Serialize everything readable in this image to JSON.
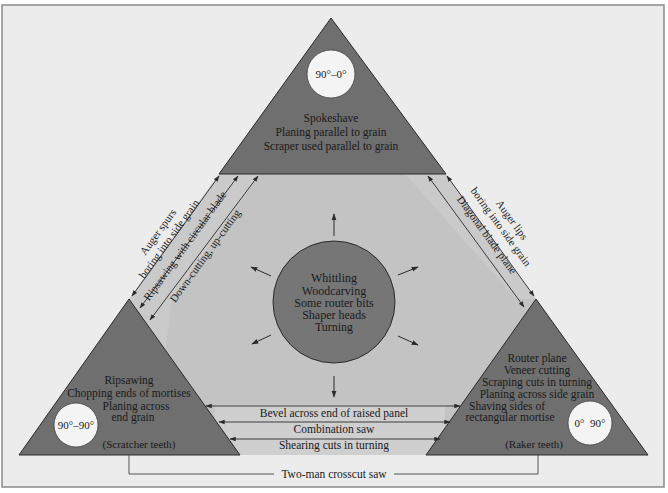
{
  "colors": {
    "background": "#ececec",
    "frame": "#8a8a8a",
    "hexagon": "#c3c3c3",
    "band": "#cfcfcf",
    "triangle": "#6f6f6f",
    "circle_center": "#767676",
    "angle_circle": "#f4f4f4",
    "line": "#2a2a2a"
  },
  "top_triangle": {
    "angle": "90°–0°",
    "lines": [
      "Spokeshave",
      "Planing parallel to grain",
      "Scraper used parallel to grain"
    ]
  },
  "left_triangle": {
    "angle": "90°–90°",
    "lines": [
      "Ripsawing",
      "Chopping ends of mortises",
      "Planing across",
      "end grain"
    ],
    "teeth": "(Scratcher teeth)"
  },
  "right_triangle": {
    "angle": "0°  90°",
    "lines": [
      "Router plane",
      "Veneer cutting",
      "Scraping cuts in turning",
      "Planing across side grain",
      "Shaving sides of",
      "rectangular mortise"
    ],
    "teeth": "(Raker teeth)"
  },
  "center": {
    "lines": [
      "Whittling",
      "Woodcarving",
      "Some router bits",
      "Shaper heads",
      "Turning"
    ]
  },
  "left_band": {
    "labels": [
      "Auger spurs",
      "boring into side grain",
      "Ripsawing with circular blade",
      "Down-cutting, up-cutting"
    ]
  },
  "right_band": {
    "labels": [
      "Auger lips",
      "boring into side grain",
      "Diagonal blade plane"
    ]
  },
  "bottom_band": {
    "labels": [
      "Bevel across end of raised panel",
      "Combination saw",
      "Shearing cuts in turning"
    ]
  },
  "outer_connector": {
    "label": "Two-man crosscut saw"
  }
}
